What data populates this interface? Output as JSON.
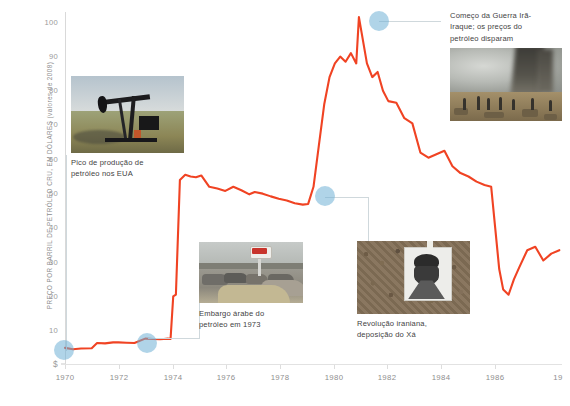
{
  "chart_data": {
    "type": "line",
    "title": "",
    "xlabel": "",
    "ylabel": "PREÇO POR BARRIL DE PETRÓLEO CRU, EM DÓLARES (valores de 2008)",
    "xlim": [
      1970,
      1988.6
    ],
    "ylim": [
      0,
      103
    ],
    "grid": false,
    "legend": null,
    "line_color": "#f04323",
    "marker_color": "#7ab4d8",
    "y_ticks": [
      "100",
      "90",
      "80",
      "70",
      "60",
      "50",
      "40",
      "30",
      "20",
      "10",
      "$"
    ],
    "y_tick_values": [
      100,
      90,
      80,
      70,
      60,
      50,
      40,
      30,
      20,
      10,
      0
    ],
    "x_ticks": [
      "1970",
      "1972",
      "1974",
      "1976",
      "1978",
      "1980",
      "1982",
      "1984",
      "1986",
      "19"
    ],
    "x_tick_values": [
      1970,
      1972,
      1974,
      1976,
      1978,
      1980,
      1982,
      1984,
      1986,
      1988
    ],
    "series": [
      {
        "name": "Preço do petróleo cru (dólares de 2008)",
        "x": [
          1970.0,
          1970.3,
          1970.6,
          1971.0,
          1971.2,
          1971.5,
          1971.8,
          1972.0,
          1972.3,
          1972.6,
          1973.0,
          1973.3,
          1973.55,
          1973.7,
          1973.85,
          1973.95,
          1974.05,
          1974.15,
          1974.3,
          1974.5,
          1974.7,
          1974.9,
          1975.1,
          1975.4,
          1975.7,
          1976.0,
          1976.3,
          1976.6,
          1976.9,
          1977.1,
          1977.4,
          1977.7,
          1978.0,
          1978.3,
          1978.6,
          1978.9,
          1979.1,
          1979.3,
          1979.5,
          1979.7,
          1979.9,
          1980.1,
          1980.3,
          1980.5,
          1980.7,
          1980.9,
          1981.0,
          1981.1,
          1981.3,
          1981.5,
          1981.7,
          1981.9,
          1982.1,
          1982.4,
          1982.7,
          1983.0,
          1983.3,
          1983.6,
          1983.9,
          1984.2,
          1984.5,
          1984.8,
          1985.1,
          1985.4,
          1985.7,
          1985.95,
          1986.1,
          1986.25,
          1986.4,
          1986.6,
          1986.8,
          1987.0,
          1987.3,
          1987.6,
          1987.9,
          1988.2,
          1988.5
        ],
        "y": [
          5.0,
          4.6,
          4.8,
          4.9,
          6.4,
          6.3,
          6.6,
          6.6,
          6.5,
          6.4,
          7.7,
          7.6,
          7.5,
          7.6,
          7.7,
          7.6,
          20.0,
          20.5,
          54.0,
          55.5,
          55.0,
          54.8,
          55.3,
          52.0,
          51.5,
          50.8,
          52.0,
          51.0,
          49.8,
          50.5,
          50.0,
          49.2,
          48.5,
          48.0,
          47.2,
          46.8,
          47.0,
          52.0,
          64.0,
          76.0,
          84.0,
          88.0,
          90.0,
          88.5,
          91.0,
          88.0,
          101.5,
          97.0,
          88.0,
          84.0,
          85.5,
          80.0,
          77.0,
          76.5,
          72.0,
          70.5,
          62.0,
          60.5,
          61.5,
          62.5,
          58.0,
          56.0,
          55.0,
          53.5,
          52.5,
          52.0,
          40.0,
          28.0,
          22.0,
          20.5,
          25.0,
          28.5,
          33.5,
          34.5,
          30.5,
          32.5,
          33.5
        ]
      }
    ],
    "markers": [
      {
        "id": "us-peak",
        "x": 1970.0,
        "y": 5.0,
        "label": "Pico de produção de petróleo nos EUA"
      },
      {
        "id": "arab-embargo",
        "x": 1973.0,
        "y": 7.7,
        "label": "Embargo árabe do petróleo em 1973"
      },
      {
        "id": "iran-revolution",
        "x": 1979.0,
        "y": 47.0,
        "label": "Revolução iraniana, deposição do Xá"
      },
      {
        "id": "iran-iraq-war",
        "x": 1981.0,
        "y": 101.5,
        "label": "Começo da Guerra Irã-Iraque; os preços do petróleo disparam"
      }
    ],
    "annotations": [
      {
        "id": "us-peak",
        "line1": "Pico de produção de",
        "line2": "petróleo nos EUA",
        "line3": ""
      },
      {
        "id": "arab-embargo",
        "line1": "Embargo árabe do",
        "line2": "petróleo em 1973",
        "line3": ""
      },
      {
        "id": "iran-revolution",
        "line1": "Revolução iraniana,",
        "line2": "deposição do Xá",
        "line3": ""
      },
      {
        "id": "iran-iraq-war",
        "line1": "Começo da Guerra Irã-",
        "line2": "Iraque; os preços do",
        "line3": "petróleo disparam"
      }
    ],
    "photos": [
      {
        "id": "oil-pump-photo",
        "caption": "Pico de produção de petróleo nos EUA"
      },
      {
        "id": "gas-station-photo",
        "caption": "Embargo árabe do petróleo em 1973"
      },
      {
        "id": "iran-crowd-photo",
        "caption": "Revolução iraniana, deposição do Xá"
      },
      {
        "id": "burning-oil-photo",
        "caption": "Começo da Guerra Irã-Iraque; os preços do petróleo disparam"
      }
    ]
  }
}
